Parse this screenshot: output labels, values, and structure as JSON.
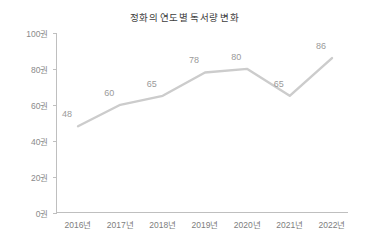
{
  "chart_data": {
    "type": "line",
    "title": "정화의 연도별 독서량 변화",
    "xlabel": "",
    "ylabel": "",
    "categories": [
      "2016년",
      "2017년",
      "2018년",
      "2019년",
      "2020년",
      "2021년",
      "2022년"
    ],
    "values": [
      48,
      60,
      65,
      78,
      80,
      65,
      86
    ],
    "point_labels": [
      "48",
      "60",
      "65",
      "78",
      "80",
      "65",
      "86"
    ],
    "ylim": [
      0,
      100
    ],
    "ytick_values": [
      0,
      20,
      40,
      60,
      80,
      100
    ],
    "ytick_labels": [
      "0권",
      "20권",
      "40권",
      "60권",
      "80권",
      "100권"
    ],
    "grid": false,
    "legend": false,
    "legend_position": "none",
    "series": [
      {
        "name": "독서량",
        "values": [
          48,
          60,
          65,
          78,
          80,
          65,
          86
        ]
      }
    ],
    "colors": {
      "line": "#cccccc",
      "axis": "#bfbfbf",
      "title_text": "#3d3d3d",
      "tick_text": "#7d7d7d",
      "point_label_text": "#9a9a9a",
      "background": "#ffffff"
    }
  }
}
